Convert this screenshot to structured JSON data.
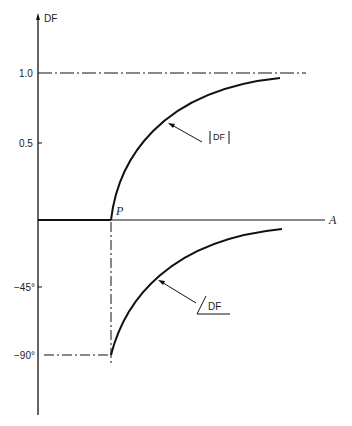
{
  "axes": {
    "y_label": "DF",
    "x_label": "A",
    "point_label": "P",
    "y_ticks_magnitude": [
      "1.0",
      "0.5"
    ],
    "y_ticks_phase": [
      "−45°",
      "−90°"
    ]
  },
  "curves": {
    "magnitude_label": "|DF|",
    "phase_label": "DF",
    "phase_symbol": "angle"
  },
  "colors": {
    "line": "#111111",
    "background": "#ffffff"
  }
}
